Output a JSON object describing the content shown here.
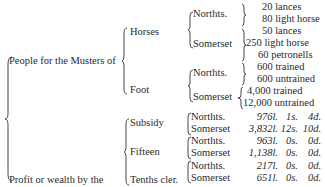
{
  "level1": {
    "musters": "People for the Musters of",
    "profit": "Profit or wealth by the"
  },
  "level2": {
    "horses": "Horses",
    "foot": "Foot",
    "subsidy": "Subsidy",
    "fifteen": "Fifteen",
    "tenths": "Tenths cler."
  },
  "counties": {
    "northants": "Northts.",
    "somerset": "Somerset"
  },
  "horses": {
    "northants": [
      "20 lances",
      "80 light horse"
    ],
    "somerset": [
      "50 lances",
      "250 light horse",
      "60 petronells"
    ]
  },
  "foot": {
    "northants": [
      "600 trained",
      "600 untrained"
    ],
    "somerset": [
      "4,000 trained",
      "12,000 untrained"
    ]
  },
  "money": [
    {
      "tax": "Subsidy",
      "county": "Northts.",
      "l": "976l.",
      "s": "1s.",
      "d": "4d."
    },
    {
      "tax": "Subsidy",
      "county": "Somerset",
      "l": "3,832l.",
      "s": "12s.",
      "d": "10d."
    },
    {
      "tax": "Fifteen",
      "county": "Northts.",
      "l": "963l.",
      "s": "0s.",
      "d": "0d."
    },
    {
      "tax": "Fifteen",
      "county": "Somerset",
      "l": "1,138l.",
      "s": "0s.",
      "d": "0d."
    },
    {
      "tax": "Tenths cler.",
      "county": "Northts.",
      "l": "217l.",
      "s": "0s.",
      "d": "0d."
    },
    {
      "tax": "Tenths cler.",
      "county": "Somerset",
      "l": "651l.",
      "s": "0s.",
      "d": "0d."
    }
  ]
}
